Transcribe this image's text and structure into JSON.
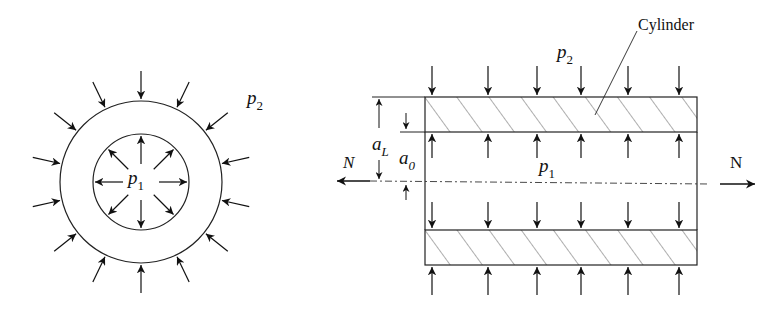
{
  "diagram": {
    "left_view": {
      "center": [
        141,
        182
      ],
      "outer_radius": 81,
      "inner_radius": 48,
      "outer_pressure_label": "p",
      "outer_pressure_sub": "2",
      "inner_pressure_label": "p",
      "inner_pressure_sub": "1",
      "outer_arrow_count": 14,
      "inner_arrow_count": 8
    },
    "right_view": {
      "cylinder_label": "Cylinder",
      "outer_pressure_label": "p",
      "outer_pressure_sub": "2",
      "inner_pressure_label": "p",
      "inner_pressure_sub": "1",
      "outer_radius_label": "a",
      "outer_radius_sub": "L",
      "inner_radius_label": "a",
      "inner_radius_sub": "0",
      "axial_force_left": "N",
      "axial_force_right": "N",
      "arrow_columns": [
        432,
        488,
        537,
        581,
        628,
        679
      ]
    },
    "colors": {
      "ink": "#111111",
      "background": "#ffffff"
    }
  }
}
